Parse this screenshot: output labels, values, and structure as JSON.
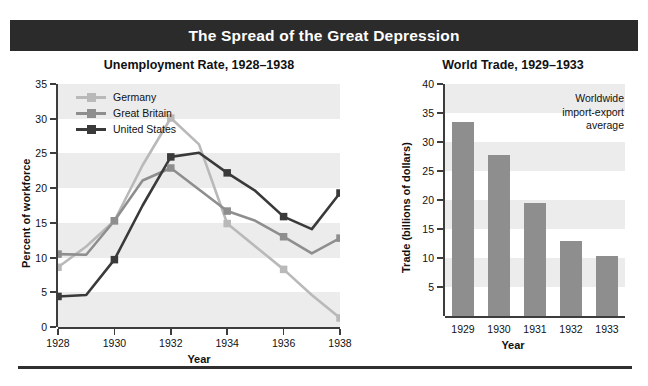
{
  "banner": {
    "title": "The Spread of the Great Depression"
  },
  "colors": {
    "germany": "#b9b9b9",
    "great_britain": "#8e8e8e",
    "united_states": "#3a3a3a",
    "bar": "#8e8e8e",
    "band": "#ececed",
    "axis": "#3d3d3d",
    "banner_bg": "#2b2b2b",
    "banner_text": "#ffffff"
  },
  "chart_data": [
    {
      "type": "line",
      "id": "unemployment",
      "title": "Unemployment Rate, 1928–1938",
      "xlabel": "Year",
      "ylabel": "Percent of workforce",
      "grid": "horizontal-bands",
      "legend_position": "top-left",
      "xlim": [
        1928,
        1938
      ],
      "ylim": [
        0,
        35
      ],
      "yticks": [
        0,
        5,
        10,
        15,
        20,
        25,
        30,
        35
      ],
      "ytick_labels": [
        "0",
        "5",
        "10",
        "15",
        "20",
        "25",
        "30",
        "35"
      ],
      "xticks": [
        1928,
        1930,
        1932,
        1934,
        1936,
        1938
      ],
      "xtick_labels": [
        "1928",
        "1930",
        "1932",
        "1934",
        "1936",
        "1938"
      ],
      "x": [
        1928,
        1929,
        1930,
        1931,
        1932,
        1933,
        1934,
        1935,
        1936,
        1937,
        1938
      ],
      "series": [
        {
          "name": "Germany",
          "color": "#b9b9b9",
          "marker_years": [
            1928,
            1930,
            1932,
            1934,
            1936,
            1938
          ],
          "marker_values": [
            8.6,
            15.3,
            30.1,
            14.9,
            8.3,
            1.3
          ],
          "values": [
            8.6,
            11.6,
            15.3,
            23.3,
            30.1,
            26.3,
            14.9,
            11.6,
            8.3,
            4.6,
            1.3
          ]
        },
        {
          "name": "Great Britain",
          "color": "#8e8e8e",
          "marker_years": [
            1928,
            1930,
            1932,
            1934,
            1936,
            1938
          ],
          "marker_values": [
            10.5,
            15.3,
            22.9,
            16.7,
            13.0,
            12.8
          ],
          "values": [
            10.5,
            10.4,
            15.3,
            21.1,
            22.9,
            19.8,
            16.7,
            15.3,
            13.0,
            10.6,
            12.8
          ]
        },
        {
          "name": "United States",
          "color": "#3a3a3a",
          "marker_years": [
            1928,
            1930,
            1932,
            1934,
            1936,
            1938
          ],
          "marker_values": [
            4.4,
            9.7,
            24.5,
            22.2,
            15.9,
            19.3
          ],
          "values": [
            4.4,
            4.6,
            9.7,
            17.5,
            24.5,
            25.1,
            22.2,
            19.6,
            15.9,
            14.1,
            19.3
          ]
        }
      ]
    },
    {
      "type": "bar",
      "id": "world-trade",
      "title": "World Trade, 1929–1933",
      "xlabel": "Year",
      "ylabel": "Trade (billions of dollars)",
      "annotation": "Worldwide import-export average",
      "annotation_lines": [
        "Worldwide",
        "import-export",
        "average"
      ],
      "grid": "horizontal-bands",
      "ylim": [
        0,
        40
      ],
      "yticks": [
        5,
        10,
        15,
        20,
        25,
        30,
        35,
        40
      ],
      "ytick_labels": [
        "5",
        "10",
        "15",
        "20",
        "25",
        "30",
        "35",
        "40"
      ],
      "categories": [
        "1929",
        "1930",
        "1931",
        "1932",
        "1933"
      ],
      "values": [
        33.5,
        27.7,
        19.5,
        13.0,
        10.3
      ],
      "bar_color": "#8e8e8e"
    }
  ]
}
